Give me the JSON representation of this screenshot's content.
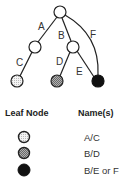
{
  "diagram": {
    "type": "tree",
    "nodes": [
      {
        "id": "root",
        "x": 60,
        "y": 12,
        "fill": "open"
      },
      {
        "id": "left-internal",
        "x": 35,
        "y": 47,
        "fill": "open"
      },
      {
        "id": "middle-internal",
        "x": 73,
        "y": 47,
        "fill": "open"
      },
      {
        "id": "leaf-c",
        "x": 17,
        "y": 81,
        "fill": "light-dotted"
      },
      {
        "id": "leaf-d",
        "x": 57,
        "y": 81,
        "fill": "gray-hatched"
      },
      {
        "id": "leaf-ef",
        "x": 98,
        "y": 81,
        "fill": "black"
      }
    ],
    "edges": [
      {
        "label": "A",
        "from": "root",
        "to": "left-internal"
      },
      {
        "label": "B",
        "from": "root",
        "to": "middle-internal"
      },
      {
        "label": "F",
        "from": "root",
        "to": "leaf-ef",
        "curved": true
      },
      {
        "label": "C",
        "from": "left-internal",
        "to": "leaf-c"
      },
      {
        "label": "D",
        "from": "middle-internal",
        "to": "leaf-d"
      },
      {
        "label": "E",
        "from": "middle-internal",
        "to": "leaf-ef"
      }
    ],
    "edge_labels": {
      "A": "A",
      "B": "B",
      "C": "C",
      "D": "D",
      "E": "E",
      "F": "F"
    }
  },
  "legend": {
    "header_leaf": "Leaf Node",
    "header_names": "Name(s)",
    "rows": [
      {
        "fill": "light-dotted",
        "name": "A/C"
      },
      {
        "fill": "gray-hatched",
        "name": "B/D"
      },
      {
        "fill": "black",
        "name": "B/E or F"
      }
    ]
  },
  "colors": {
    "stroke": "#222222",
    "open_fill": "#ffffff",
    "light_fill": "#e2e2e2",
    "gray_fill": "#9a9a9a",
    "black_fill": "#111111"
  }
}
